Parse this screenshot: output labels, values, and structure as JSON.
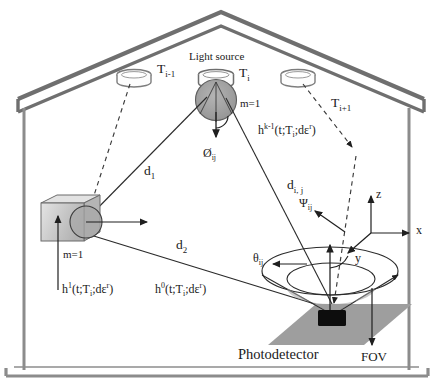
{
  "figure": {
    "room": {
      "name": "room-outline",
      "wall_color": "#8c8c8c",
      "roof_color": "#7a7a7a"
    },
    "colors": {
      "line": "#2b2b2b",
      "wall": "#8c8c8c",
      "roof": "#6f6f6f",
      "lambertian_fill": "#9a9a9a",
      "surface_fill": "#9e9e9e",
      "detector_fill": "#0d0d0d",
      "cube_fill": "#c9c9c9",
      "cube_top": "#e2e2e2"
    }
  },
  "labels": {
    "light_source": "Light source",
    "transmitter_prev": "T",
    "transmitter_prev_sub": "i-1",
    "transmitter_cur": "T",
    "transmitter_cur_sub": "i",
    "transmitter_next": "T",
    "transmitter_next_sub": "i+1",
    "lambertian_order_source": "m=1",
    "lambertian_order_wall": "m=1",
    "distance_1": "d",
    "distance_1_sub": "1",
    "distance_2": "d",
    "distance_2_sub": "2",
    "distance_ij": "d",
    "distance_ij_sub": "i, j",
    "angle_irradiance": "Ø",
    "angle_irradiance_sub": "ij",
    "angle_incidence": "θ",
    "angle_incidence_sub": "ij",
    "angle_psi": "Ψ",
    "angle_psi_sub": "ij",
    "h_k_base": "h",
    "h_k_sup": "k-1",
    "h_k_args": "(t;T",
    "h_k_args_sub": "i",
    "h_k_args_tail": ";dε",
    "h_k_args_sup": "r",
    "h_k_args_close": ")",
    "h_1_base": "h",
    "h_1_sup": "1",
    "h_1_args": "(t;T",
    "h_1_args_sub": "i",
    "h_1_args_tail": ";dε",
    "h_1_args_sup": "r",
    "h_1_args_close": ")",
    "h_0_base": "h",
    "h_0_sup": "0",
    "h_0_args": "(t;T",
    "h_0_args_sub": "i",
    "h_0_args_tail": ";dε",
    "h_0_args_sup": "r",
    "h_0_args_close": ")",
    "photodetector": "Photodetector",
    "fov": "FOV",
    "axis_z": "z",
    "axis_x": "x",
    "axis_y": "y"
  }
}
